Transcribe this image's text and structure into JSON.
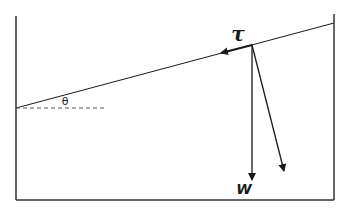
{
  "diagram": {
    "title": "",
    "type": "inclined-surface-force-diagram",
    "labels": {
      "angle": "θ",
      "shear_stress": "τ",
      "weight": "W"
    },
    "colors": {
      "stroke": "#1a1a1a",
      "dashed": "#555555",
      "background": "#ffffff"
    },
    "elements": [
      {
        "name": "container-box",
        "description": "Open-top container: left wall, right wall, bottom"
      },
      {
        "name": "inclined-surface",
        "description": "Sloped line from left wall to right wall at angle θ"
      },
      {
        "name": "horizontal-reference",
        "description": "Dashed horizontal reference line at left"
      },
      {
        "name": "shear-arrow",
        "label": "τ",
        "description": "Arrow along slope pointing down-slope"
      },
      {
        "name": "weight-arrow",
        "label": "W",
        "description": "Vertical downward arrow"
      },
      {
        "name": "normal-component-arrow",
        "description": "Slanted downward arrow perpendicular to slope"
      }
    ]
  }
}
